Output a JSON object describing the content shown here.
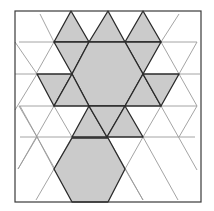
{
  "diagram": {
    "kind": "pattern-block-figure-on-triangular-grid",
    "fill_color": "#cbcbcb",
    "stroke_color": "#2a2a2a",
    "grid_color": "#9a9a9a",
    "frame": {
      "x": 15,
      "y": 11,
      "width": 186,
      "height": 191
    },
    "pieces": [
      {
        "type": "triangle",
        "points": "71,11 54,42 89,42"
      },
      {
        "type": "triangle",
        "points": "108,11 89,42 125,42"
      },
      {
        "type": "triangle",
        "points": "143,11 125,42 161,42"
      },
      {
        "type": "triangle",
        "points": "54,42 89,42 72,74"
      },
      {
        "type": "triangle",
        "points": "125,42 161,42 143,74"
      },
      {
        "type": "hexagon",
        "points": "89,42 125,42 143,74 125,106 89,106 72,74"
      },
      {
        "type": "rhombus",
        "points": "37,74 72,74 54,106 19,106"
      },
      {
        "type": "triangle",
        "points": "72,74 89,106 54,106"
      },
      {
        "type": "triangle",
        "points": "143,74 161,106 125,106"
      },
      {
        "type": "rhombus",
        "points": "143,74 179,74 161,106 161,106"
      },
      {
        "type": "triangle",
        "points": "89,106 107,137 72,137"
      },
      {
        "type": "triangle",
        "points": "89,106 125,106 107,137"
      },
      {
        "type": "triangle",
        "points": "125,106 143,137 107,137"
      },
      {
        "type": "hexagon",
        "points": "72,138 108,138 125,169 108,202 72,202 54,169"
      }
    ]
  }
}
